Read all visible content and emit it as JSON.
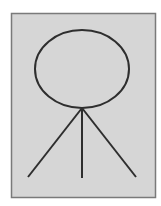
{
  "diagram": {
    "colors": {
      "background": "#ffffff",
      "panel_fill": "#d6d6d6",
      "panel_border": "#7a7a7a",
      "stroke": "#2e2e2e"
    },
    "panel": {
      "x": 11,
      "y": 13,
      "width": 144,
      "height": 184
    },
    "head": {
      "cx": 82,
      "cy": 69,
      "rx": 47,
      "ry": 39
    },
    "apex": {
      "x": 82,
      "y": 108
    },
    "legs": [
      {
        "x2": 28,
        "y2": 177
      },
      {
        "x2": 82,
        "y2": 178
      },
      {
        "x2": 136,
        "y2": 177
      }
    ]
  }
}
